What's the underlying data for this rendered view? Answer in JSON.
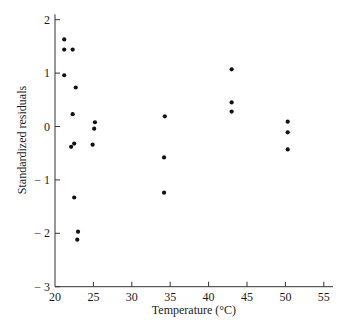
{
  "chart_data": {
    "type": "scatter",
    "title": "",
    "xlabel": "Temperature (°C)",
    "ylabel": "Standardized residuals",
    "xlim": [
      20,
      56.2
    ],
    "ylim": [
      -3,
      2.1
    ],
    "xticks": [
      20,
      25,
      30,
      35,
      40,
      45,
      50,
      55
    ],
    "yticks": [
      -3,
      -2,
      -1,
      0,
      1,
      2
    ],
    "xtick_labels": [
      "20",
      "25",
      "30",
      "35",
      "40",
      "45",
      "50",
      "55"
    ],
    "ytick_labels": [
      "− 3",
      "− 2",
      "− 1",
      "0",
      "1",
      "2"
    ],
    "grid": false,
    "legend": null,
    "marker_color": "#111111",
    "series": [
      {
        "name": "residuals",
        "points": [
          {
            "x": 21.2,
            "y": 1.63
          },
          {
            "x": 21.2,
            "y": 1.44
          },
          {
            "x": 22.3,
            "y": 1.44
          },
          {
            "x": 21.2,
            "y": 0.96
          },
          {
            "x": 22.7,
            "y": 0.73
          },
          {
            "x": 22.3,
            "y": 0.23
          },
          {
            "x": 25.2,
            "y": 0.08
          },
          {
            "x": 25.1,
            "y": -0.04
          },
          {
            "x": 22.1,
            "y": -0.38
          },
          {
            "x": 22.5,
            "y": -0.32
          },
          {
            "x": 24.9,
            "y": -0.34
          },
          {
            "x": 22.5,
            "y": -1.33
          },
          {
            "x": 23.0,
            "y": -1.97
          },
          {
            "x": 22.9,
            "y": -2.12
          },
          {
            "x": 34.3,
            "y": 0.19
          },
          {
            "x": 34.2,
            "y": -0.58
          },
          {
            "x": 34.2,
            "y": -1.24
          },
          {
            "x": 43.0,
            "y": 1.07
          },
          {
            "x": 43.0,
            "y": 0.45
          },
          {
            "x": 43.0,
            "y": 0.28
          },
          {
            "x": 50.3,
            "y": 0.09
          },
          {
            "x": 50.3,
            "y": -0.11
          },
          {
            "x": 50.3,
            "y": -0.43
          }
        ]
      }
    ]
  }
}
